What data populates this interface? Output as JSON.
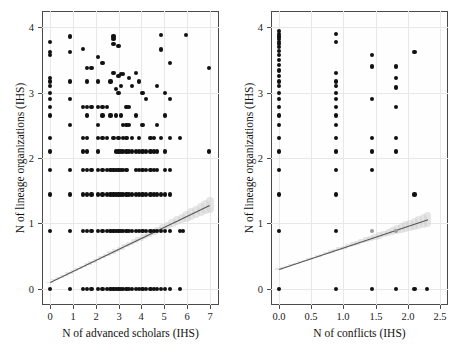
{
  "figure": {
    "type": "scatter-panel-figure",
    "panel_count": 2,
    "background": "#ffffff",
    "point_color": "#111111",
    "fitline_color": "#55555a",
    "band_color": "#cfcfcf",
    "grid_color": "#e8e8e8",
    "axis_color": "#4a4a4a"
  },
  "chart_data": [
    {
      "type": "scatter",
      "panel": "left",
      "title": "",
      "xlabel": "N of advanced scholars (IHS)",
      "ylabel": "N of lineage organizations (IHS)",
      "xlim": [
        -0.35,
        7.4
      ],
      "ylim": [
        -0.25,
        4.25
      ],
      "xticks": [
        0,
        1,
        2,
        3,
        4,
        5,
        6,
        7
      ],
      "xticklabels": [
        "0",
        "1",
        "2",
        "3",
        "4",
        "5",
        "6",
        "7"
      ],
      "yticks": [
        0,
        1,
        2,
        3,
        4
      ],
      "yticklabels": [
        "0",
        "1",
        "2",
        "3",
        "4"
      ],
      "grid": true,
      "legend": false,
      "fit": {
        "kind": "linear-regression",
        "intercept": 0.1,
        "slope": 0.168,
        "x_start": 0.0,
        "x_end": 7.0,
        "y_start": 0.1,
        "y_end": 1.28,
        "confidence_band": true
      },
      "points": [
        [
          0.0,
          3.78
        ],
        [
          0.0,
          3.62
        ],
        [
          0.0,
          3.58
        ],
        [
          0.0,
          3.22
        ],
        [
          0.0,
          3.17
        ],
        [
          0.0,
          3.1
        ],
        [
          0.0,
          3.0
        ],
        [
          0.0,
          2.9
        ],
        [
          0.0,
          2.78
        ],
        [
          0.0,
          2.65
        ],
        [
          0.0,
          2.3
        ],
        [
          0.0,
          2.1
        ],
        [
          0.0,
          1.82
        ],
        [
          0.0,
          1.44
        ],
        [
          0.0,
          0.88
        ],
        [
          0.0,
          0.0
        ],
        [
          0.88,
          3.86
        ],
        [
          0.88,
          3.62
        ],
        [
          0.88,
          3.17
        ],
        [
          0.88,
          2.9
        ],
        [
          0.88,
          2.5
        ],
        [
          0.88,
          1.82
        ],
        [
          0.88,
          1.44
        ],
        [
          0.88,
          0.88
        ],
        [
          0.88,
          0.0
        ],
        [
          1.44,
          3.67
        ],
        [
          1.44,
          2.78
        ],
        [
          1.44,
          2.3
        ],
        [
          1.44,
          2.1
        ],
        [
          1.44,
          1.82
        ],
        [
          1.44,
          1.44
        ],
        [
          1.44,
          0.88
        ],
        [
          1.44,
          0.0
        ],
        [
          1.62,
          3.38
        ],
        [
          1.62,
          3.17
        ],
        [
          1.62,
          2.78
        ],
        [
          1.62,
          2.65
        ],
        [
          1.62,
          2.3
        ],
        [
          1.62,
          2.1
        ],
        [
          1.62,
          1.82
        ],
        [
          1.62,
          1.44
        ],
        [
          1.62,
          0.88
        ],
        [
          1.62,
          0.0
        ],
        [
          1.82,
          3.38
        ],
        [
          1.82,
          2.78
        ],
        [
          1.82,
          1.82
        ],
        [
          1.82,
          1.44
        ],
        [
          1.82,
          0.88
        ],
        [
          1.82,
          0.0
        ],
        [
          2.1,
          3.55
        ],
        [
          2.1,
          3.17
        ],
        [
          2.1,
          2.78
        ],
        [
          2.1,
          2.5
        ],
        [
          2.1,
          2.3
        ],
        [
          2.1,
          2.1
        ],
        [
          2.1,
          1.82
        ],
        [
          2.1,
          1.44
        ],
        [
          2.1,
          0.88
        ],
        [
          2.1,
          0.0
        ],
        [
          2.3,
          3.45
        ],
        [
          2.3,
          2.78
        ],
        [
          2.3,
          2.65
        ],
        [
          2.3,
          2.3
        ],
        [
          2.3,
          1.82
        ],
        [
          2.3,
          1.44
        ],
        [
          2.3,
          0.88
        ],
        [
          2.3,
          0.0
        ],
        [
          2.5,
          2.78
        ],
        [
          2.5,
          2.3
        ],
        [
          2.5,
          1.82
        ],
        [
          2.5,
          1.44
        ],
        [
          2.5,
          0.88
        ],
        [
          2.5,
          0.0
        ],
        [
          2.65,
          3.17
        ],
        [
          2.65,
          2.65
        ],
        [
          2.65,
          1.82
        ],
        [
          2.65,
          1.44
        ],
        [
          2.65,
          0.88
        ],
        [
          2.65,
          0.0
        ],
        [
          2.78,
          3.86
        ],
        [
          2.78,
          3.82
        ],
        [
          2.78,
          3.74
        ],
        [
          2.78,
          3.3
        ],
        [
          2.78,
          2.3
        ],
        [
          2.78,
          1.82
        ],
        [
          2.78,
          1.44
        ],
        [
          2.78,
          0.88
        ],
        [
          2.78,
          0.0
        ],
        [
          2.9,
          3.06
        ],
        [
          2.9,
          2.65
        ],
        [
          2.9,
          2.1
        ],
        [
          2.9,
          1.82
        ],
        [
          2.9,
          1.44
        ],
        [
          2.9,
          0.88
        ],
        [
          2.9,
          0.0
        ],
        [
          3.0,
          3.72
        ],
        [
          3.0,
          3.26
        ],
        [
          3.0,
          3.0
        ],
        [
          3.0,
          2.3
        ],
        [
          3.0,
          2.1
        ],
        [
          3.0,
          1.82
        ],
        [
          3.0,
          1.44
        ],
        [
          3.0,
          0.88
        ],
        [
          3.0,
          0.0
        ],
        [
          3.1,
          3.28
        ],
        [
          3.1,
          3.1
        ],
        [
          3.1,
          2.65
        ],
        [
          3.1,
          2.1
        ],
        [
          3.1,
          1.82
        ],
        [
          3.1,
          1.44
        ],
        [
          3.1,
          0.88
        ],
        [
          3.1,
          0.0
        ],
        [
          3.2,
          3.28
        ],
        [
          3.2,
          2.5
        ],
        [
          3.2,
          2.3
        ],
        [
          3.2,
          2.1
        ],
        [
          3.2,
          1.82
        ],
        [
          3.2,
          1.44
        ],
        [
          3.2,
          0.88
        ],
        [
          3.2,
          0.0
        ],
        [
          3.35,
          2.78
        ],
        [
          3.35,
          2.5
        ],
        [
          3.35,
          2.3
        ],
        [
          3.35,
          2.1
        ],
        [
          3.35,
          1.82
        ],
        [
          3.35,
          1.44
        ],
        [
          3.35,
          0.88
        ],
        [
          3.35,
          0.0
        ],
        [
          3.45,
          3.22
        ],
        [
          3.45,
          2.78
        ],
        [
          3.45,
          2.5
        ],
        [
          3.45,
          2.1
        ],
        [
          3.45,
          1.44
        ],
        [
          3.45,
          0.88
        ],
        [
          3.45,
          0.0
        ],
        [
          3.6,
          3.1
        ],
        [
          3.6,
          2.3
        ],
        [
          3.6,
          2.1
        ],
        [
          3.6,
          1.44
        ],
        [
          3.6,
          0.88
        ],
        [
          3.6,
          0.0
        ],
        [
          3.75,
          3.3
        ],
        [
          3.75,
          2.65
        ],
        [
          3.75,
          2.1
        ],
        [
          3.75,
          1.82
        ],
        [
          3.75,
          1.44
        ],
        [
          3.75,
          0.88
        ],
        [
          3.75,
          0.0
        ],
        [
          3.9,
          3.17
        ],
        [
          3.9,
          2.3
        ],
        [
          3.9,
          2.1
        ],
        [
          3.9,
          1.82
        ],
        [
          3.9,
          1.44
        ],
        [
          3.9,
          0.88
        ],
        [
          3.9,
          0.0
        ],
        [
          4.05,
          3.0
        ],
        [
          4.05,
          2.5
        ],
        [
          4.05,
          2.1
        ],
        [
          4.05,
          1.82
        ],
        [
          4.05,
          1.44
        ],
        [
          4.05,
          0.88
        ],
        [
          4.05,
          0.0
        ],
        [
          4.2,
          2.9
        ],
        [
          4.2,
          2.1
        ],
        [
          4.2,
          1.82
        ],
        [
          4.2,
          1.44
        ],
        [
          4.2,
          0.88
        ],
        [
          4.2,
          0.0
        ],
        [
          4.4,
          2.3
        ],
        [
          4.4,
          2.1
        ],
        [
          4.4,
          1.82
        ],
        [
          4.4,
          1.44
        ],
        [
          4.4,
          0.88
        ],
        [
          4.4,
          0.0
        ],
        [
          4.55,
          2.3
        ],
        [
          4.55,
          2.1
        ],
        [
          4.55,
          1.82
        ],
        [
          4.55,
          1.44
        ],
        [
          4.55,
          0.88
        ],
        [
          4.55,
          0.0
        ],
        [
          4.7,
          3.1
        ],
        [
          4.7,
          2.5
        ],
        [
          4.7,
          2.1
        ],
        [
          4.7,
          1.82
        ],
        [
          4.7,
          1.44
        ],
        [
          4.7,
          0.88
        ],
        [
          4.7,
          0.0
        ],
        [
          4.85,
          3.88
        ],
        [
          4.85,
          3.66
        ],
        [
          4.85,
          2.3
        ],
        [
          4.85,
          1.44
        ],
        [
          4.85,
          0.88
        ],
        [
          4.85,
          0.0
        ],
        [
          5.05,
          3.0
        ],
        [
          5.05,
          2.65
        ],
        [
          5.05,
          2.1
        ],
        [
          5.05,
          1.82
        ],
        [
          5.05,
          1.44
        ],
        [
          5.05,
          0.88
        ],
        [
          5.05,
          0.0
        ],
        [
          5.25,
          3.45
        ],
        [
          5.25,
          2.9
        ],
        [
          5.25,
          2.3
        ],
        [
          5.25,
          1.82
        ],
        [
          5.25,
          1.44
        ],
        [
          5.25,
          0.88
        ],
        [
          5.25,
          0.0
        ],
        [
          5.7,
          2.3
        ],
        [
          5.7,
          0.88
        ],
        [
          5.7,
          0.0
        ],
        [
          5.82,
          0.88
        ],
        [
          5.95,
          3.88
        ],
        [
          6.95,
          3.38
        ],
        [
          6.95,
          2.1
        ]
      ]
    },
    {
      "type": "scatter",
      "panel": "right",
      "title": "",
      "xlabel": "N of conflicts (IHS)",
      "ylabel": "N of lineage organizations (IHS)",
      "xlim": [
        -0.12,
        2.62
      ],
      "ylim": [
        -0.25,
        4.25
      ],
      "xticks": [
        0.0,
        0.5,
        1.0,
        1.5,
        2.0,
        2.5
      ],
      "xticklabels": [
        "0.0",
        "0.5",
        "1.0",
        "1.5",
        "2.0",
        "2.5"
      ],
      "yticks": [
        0,
        1,
        2,
        3,
        4
      ],
      "yticklabels": [
        "0",
        "1",
        "2",
        "3",
        "4"
      ],
      "grid": true,
      "legend": false,
      "fit": {
        "kind": "linear-regression",
        "intercept": 0.3,
        "slope": 0.33,
        "x_start": 0.0,
        "x_end": 2.3,
        "y_start": 0.3,
        "y_end": 1.06,
        "confidence_band": true
      },
      "points": [
        [
          0.0,
          3.95
        ],
        [
          0.0,
          3.9
        ],
        [
          0.0,
          3.86
        ],
        [
          0.0,
          3.82
        ],
        [
          0.0,
          3.78
        ],
        [
          0.0,
          3.74
        ],
        [
          0.0,
          3.7
        ],
        [
          0.0,
          3.64
        ],
        [
          0.0,
          3.58
        ],
        [
          0.0,
          3.5
        ],
        [
          0.0,
          3.42
        ],
        [
          0.0,
          3.34
        ],
        [
          0.0,
          3.26
        ],
        [
          0.0,
          3.17
        ],
        [
          0.0,
          3.1
        ],
        [
          0.0,
          3.0
        ],
        [
          0.0,
          2.9
        ],
        [
          0.0,
          2.78
        ],
        [
          0.0,
          2.65
        ],
        [
          0.0,
          2.5
        ],
        [
          0.0,
          2.3
        ],
        [
          0.0,
          2.1
        ],
        [
          0.0,
          1.82
        ],
        [
          0.0,
          1.44
        ],
        [
          0.0,
          0.88
        ],
        [
          0.0,
          0.0
        ],
        [
          0.88,
          3.9
        ],
        [
          0.88,
          3.78
        ],
        [
          0.88,
          3.3
        ],
        [
          0.88,
          3.17
        ],
        [
          0.88,
          3.1
        ],
        [
          0.88,
          3.0
        ],
        [
          0.88,
          2.9
        ],
        [
          0.88,
          2.78
        ],
        [
          0.88,
          2.65
        ],
        [
          0.88,
          2.5
        ],
        [
          0.88,
          2.3
        ],
        [
          0.88,
          2.1
        ],
        [
          0.88,
          1.82
        ],
        [
          0.88,
          1.44
        ],
        [
          0.88,
          0.88
        ],
        [
          0.88,
          0.0
        ],
        [
          1.44,
          3.58
        ],
        [
          1.44,
          3.4
        ],
        [
          1.44,
          2.9
        ],
        [
          1.44,
          2.3
        ],
        [
          1.44,
          2.1
        ],
        [
          1.44,
          1.82
        ],
        [
          1.44,
          0.88
        ],
        [
          1.44,
          0.0
        ],
        [
          1.82,
          3.4
        ],
        [
          1.82,
          3.22
        ],
        [
          1.82,
          3.08
        ],
        [
          1.82,
          2.78
        ],
        [
          1.82,
          2.3
        ],
        [
          1.82,
          2.1
        ],
        [
          1.82,
          0.88
        ],
        [
          1.82,
          0.0
        ],
        [
          2.1,
          3.62
        ],
        [
          2.1,
          1.44
        ],
        [
          2.1,
          0.0
        ],
        [
          2.3,
          0.0
        ]
      ],
      "highlighted_points": [
        [
          1.44,
          0.88
        ],
        [
          1.82,
          0.88
        ]
      ]
    }
  ]
}
